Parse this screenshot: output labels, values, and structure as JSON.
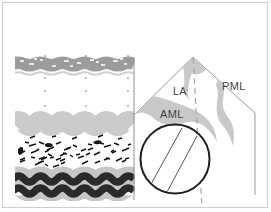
{
  "labels": {
    "la": "LA",
    "aml": "AML",
    "pml": "PML"
  },
  "colors": {
    "frame_border": "#cfcfcf",
    "label_text": "#3f3f3f",
    "leaflet_gray": "#c9c9c9",
    "sector_outline": "#9a9a9a",
    "cursor_line": "#a8a8a8",
    "circle_outline": "#1e1e1e",
    "orifice_lines": "#555555",
    "strip_edge_line": "#8f8f8f",
    "top_band": "#9c9c9c",
    "top_band_underline": "#d0d0d0",
    "top_band_speckle": "#ffffff",
    "septum_band": "#cbcbcb",
    "wave_envelope": "#c6c6c6",
    "wave_dark": "#2a2a2a",
    "speckle": "#161616",
    "calibration_dot": "#a9a9a9"
  }
}
